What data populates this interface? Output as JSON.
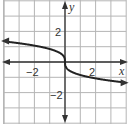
{
  "chart_data": {
    "type": "line",
    "title": "",
    "xlabel": "x",
    "ylabel": "y",
    "xlim": [
      -4.2,
      4.2
    ],
    "ylim": [
      -4.0,
      4.0
    ],
    "grid": true,
    "grid_step": 1,
    "x_ticks_labeled": [
      -2,
      2
    ],
    "y_ticks_labeled": [
      2,
      -2
    ],
    "tick_labels": {
      "x_neg": "−2",
      "x_pos": "2",
      "y_pos": "2",
      "y_neg": "−2"
    },
    "series": [
      {
        "name": "y = -k·∛x",
        "description": "Decreasing cube-root curve through origin with vertical tangent, arrows at both ends",
        "x": [
          -4,
          -3,
          -2,
          -1,
          -0.5,
          -0.1,
          0,
          0.1,
          0.5,
          1,
          2,
          3,
          4
        ],
        "y": [
          1.35,
          1.23,
          1.07,
          0.85,
          0.67,
          0.39,
          0,
          -0.39,
          -0.67,
          -0.85,
          -1.07,
          -1.23,
          -1.35
        ]
      }
    ],
    "colors": {
      "grid": "#b5b5b5",
      "axis": "#333333",
      "curve": "#222222"
    }
  }
}
